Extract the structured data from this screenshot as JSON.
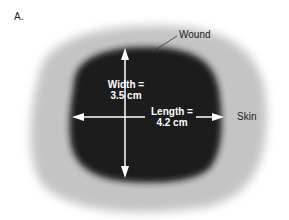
{
  "panel_label": "A.",
  "labels": {
    "wound": "Wound",
    "skin": "Skin",
    "width_line1": "Width =",
    "width_line2": "3.5 cm",
    "length_line1": "Length =",
    "length_line2": "4.2 cm"
  },
  "measurements": {
    "width_cm": 3.5,
    "length_cm": 4.2
  },
  "colors": {
    "skin": "#c2c2c2",
    "wound": "#1e1e1e",
    "arrows": "#ffffff",
    "text": "#222222"
  }
}
